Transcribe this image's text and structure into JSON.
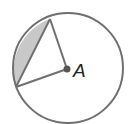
{
  "diagram": {
    "type": "geometry-circle-segment",
    "center_label": "A",
    "colors": {
      "stroke": "#707070",
      "shade": "#c8c8c8",
      "center_dot": "#555555",
      "label": "#222222"
    },
    "elements": [
      {
        "name": "circle",
        "center": "A"
      },
      {
        "name": "radius",
        "from": "A",
        "to": "upper point on circle"
      },
      {
        "name": "radius",
        "from": "A",
        "to": "lower-left point on circle"
      },
      {
        "name": "chord",
        "between": "the two radius endpoints"
      },
      {
        "name": "shaded-segment",
        "bounded_by": "chord and minor arc"
      }
    ]
  }
}
